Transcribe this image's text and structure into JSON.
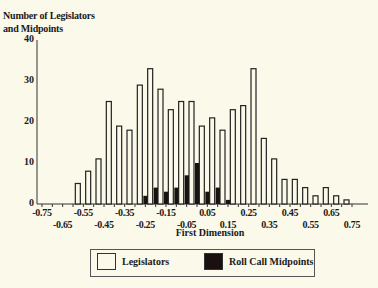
{
  "chart_data": {
    "type": "bar",
    "title": "",
    "ylabel": "Number of Legislators and Midpoints",
    "ylabel_lines": [
      "Number of Legislators",
      "and Midpoints"
    ],
    "xlabel": "First Dimension",
    "ylim": [
      0,
      40
    ],
    "yticks": [
      "0",
      "10",
      "20",
      "30",
      "40"
    ],
    "xlim": [
      -0.75,
      0.75
    ],
    "xticks_upper": [
      "-0.75",
      "-0.55",
      "-0.35",
      "-0.15",
      "0.05",
      "0.25",
      "0.45",
      "0.65"
    ],
    "xticks_lower": [
      "-0.65",
      "-0.45",
      "-0.25",
      "-0.05",
      "0.15",
      "0.35",
      "0.55",
      "0.75"
    ],
    "grid": false,
    "legend_position": "bottom",
    "categories": [
      -0.55,
      -0.5,
      -0.45,
      -0.4,
      -0.35,
      -0.3,
      -0.25,
      -0.2,
      -0.15,
      -0.1,
      -0.05,
      0.0,
      0.05,
      0.1,
      0.15,
      0.2,
      0.25,
      0.3,
      0.35,
      0.4,
      0.45,
      0.5,
      0.55,
      0.6,
      0.65,
      0.7,
      0.75
    ],
    "series": [
      {
        "name": "Legislators",
        "color": "#fbf9ea",
        "values": [
          5,
          8,
          11,
          25,
          19,
          18,
          29,
          33,
          28,
          23,
          25,
          25,
          19,
          21,
          18,
          23,
          24,
          33,
          16,
          11,
          6,
          6,
          4,
          2,
          4,
          2,
          1
        ]
      },
      {
        "name": "Roll Call Midpoints",
        "color": "#1a1010",
        "values": [
          0,
          0,
          0,
          0,
          0,
          0,
          2,
          4,
          3,
          4,
          7,
          10,
          3,
          4,
          1,
          0,
          0,
          0,
          0,
          0,
          0,
          0,
          0,
          0,
          0,
          0,
          0
        ]
      }
    ]
  },
  "legend": {
    "items": [
      {
        "label": "Legislators",
        "style": "open"
      },
      {
        "label": "Roll Call Midpoints",
        "style": "solid"
      }
    ]
  }
}
